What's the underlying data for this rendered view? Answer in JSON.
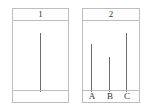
{
  "panels": [
    {
      "title": "1",
      "sticks": [
        {
          "label": "",
          "top": 32
        }
      ]
    },
    {
      "title": "2",
      "sticks": [
        {
          "label": "A",
          "top": 43
        },
        {
          "label": "B",
          "top": 56
        },
        {
          "label": "C",
          "top": 32
        }
      ]
    }
  ]
}
